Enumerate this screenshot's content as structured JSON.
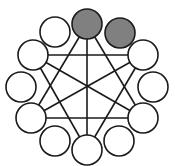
{
  "diagram": {
    "type": "graph",
    "colors": {
      "stroke": "#1a1a1a",
      "filled": "#808080",
      "empty": "#ffffff"
    },
    "center": {
      "x": 87,
      "y": 87
    },
    "radius": 15,
    "nodes": [
      {
        "id": "n0",
        "x": 87,
        "y": 24,
        "filled": true
      },
      {
        "id": "n1",
        "x": 120,
        "y": 33,
        "filled": true
      },
      {
        "id": "n2",
        "x": 143,
        "y": 55,
        "filled": false
      },
      {
        "id": "n3",
        "x": 153,
        "y": 87,
        "filled": false
      },
      {
        "id": "n4",
        "x": 143,
        "y": 118,
        "filled": false
      },
      {
        "id": "n5",
        "x": 119,
        "y": 141,
        "filled": false
      },
      {
        "id": "n6",
        "x": 87,
        "y": 150,
        "filled": false
      },
      {
        "id": "n7",
        "x": 55,
        "y": 141,
        "filled": false
      },
      {
        "id": "n8",
        "x": 31,
        "y": 118,
        "filled": false
      },
      {
        "id": "n9",
        "x": 21,
        "y": 87,
        "filled": false
      },
      {
        "id": "n10",
        "x": 33,
        "y": 55,
        "filled": false
      },
      {
        "id": "n11",
        "x": 55,
        "y": 32,
        "filled": false
      }
    ],
    "edges": [
      [
        "n0",
        "n6"
      ],
      [
        "n0",
        "n8"
      ],
      [
        "n0",
        "n4"
      ],
      [
        "n10",
        "n2"
      ],
      [
        "n10",
        "n6"
      ],
      [
        "n10",
        "n4"
      ],
      [
        "n2",
        "n6"
      ],
      [
        "n2",
        "n8"
      ],
      [
        "n8",
        "n4"
      ]
    ]
  }
}
